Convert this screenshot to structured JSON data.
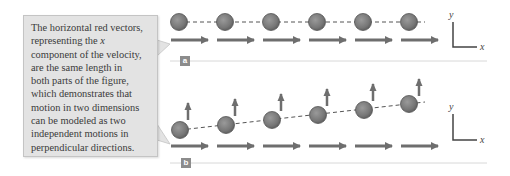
{
  "callout": {
    "lines": [
      "The horizontal red vectors,",
      "representing the x",
      "component of the velocity,",
      "are the same length in",
      "both parts of the figure,",
      "which demonstrates that",
      "motion in two dimensions",
      "can be modeled as two",
      "independent motions in",
      "perpendicular directions."
    ]
  },
  "parts": {
    "a": {
      "label": "a",
      "axis_x": "x",
      "axis_y": "y"
    },
    "b": {
      "label": "b",
      "axis_x": "x",
      "axis_y": "y"
    }
  },
  "colors": {
    "ball": "#7b7b7b",
    "ball_edge": "#555555",
    "vector": "#6e6e6e",
    "callout_bg": "#e3e3e3",
    "divider": "#d8d8d8",
    "axis": "#444444"
  },
  "diagram": {
    "part_a": {
      "balls": [
        [
          179,
          22
        ],
        [
          225,
          22
        ],
        [
          271,
          22
        ],
        [
          317,
          22
        ],
        [
          363,
          22
        ],
        [
          409,
          22
        ]
      ],
      "horizontal_vectors": [
        [
          171,
          40
        ],
        [
          217,
          40
        ],
        [
          263,
          40
        ],
        [
          309,
          40
        ],
        [
          355,
          40
        ],
        [
          401,
          40
        ]
      ],
      "vector_length": 37
    },
    "part_b": {
      "balls": [
        [
          180,
          130
        ],
        [
          226,
          125
        ],
        [
          272,
          120
        ],
        [
          318,
          115
        ],
        [
          364,
          110
        ],
        [
          409,
          104
        ]
      ],
      "vertical_vectors": [
        [
          188,
          120
        ],
        [
          235,
          116
        ],
        [
          281,
          111
        ],
        [
          327,
          106
        ],
        [
          373,
          101
        ],
        [
          419,
          96
        ]
      ],
      "vertical_length": 17,
      "horizontal_vectors": [
        [
          171,
          146
        ],
        [
          217,
          146
        ],
        [
          263,
          146
        ],
        [
          309,
          146
        ],
        [
          355,
          146
        ],
        [
          401,
          146
        ]
      ],
      "vector_length": 37
    }
  }
}
